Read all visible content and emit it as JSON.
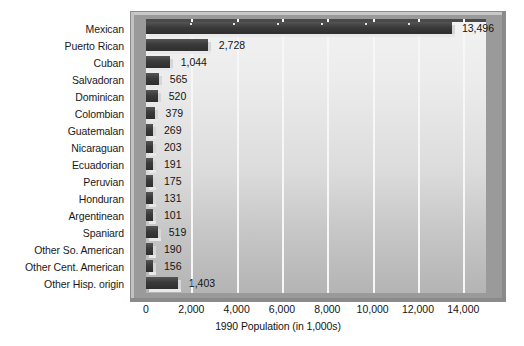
{
  "chart_data": {
    "type": "bar",
    "orientation": "horizontal",
    "title": "",
    "xlabel": "1990 Population (in 1,000s)",
    "ylabel": "",
    "xlim": [
      0,
      15000
    ],
    "grid": true,
    "legend": "none",
    "xticks": [
      "0",
      "2,000",
      "4,000",
      "6,000",
      "8,000",
      "10,000",
      "12,000",
      "14,000"
    ],
    "xtick_values": [
      0,
      2000,
      4000,
      6000,
      8000,
      10000,
      12000,
      14000
    ],
    "categories": [
      "Mexican",
      "Puerto Rican",
      "Cuban",
      "Salvadoran",
      "Dominican",
      "Colombian",
      "Guatemalan",
      "Nicaraguan",
      "Ecuadorian",
      "Peruvian",
      "Honduran",
      "Argentinean",
      "Spaniard",
      "Other So. American",
      "Other Cent. American",
      "Other Hisp. origin"
    ],
    "values": [
      13496,
      2728,
      1044,
      565,
      520,
      379,
      269,
      203,
      191,
      175,
      131,
      101,
      519,
      190,
      156,
      1403
    ],
    "value_labels": [
      "13,496",
      "2,728",
      "1,044",
      "565",
      "520",
      "379",
      "269",
      "203",
      "191",
      "175",
      "131",
      "101",
      "519",
      "190",
      "156",
      "1,403"
    ],
    "colors": {
      "bar": "#3a3a3a",
      "bar_highlight": "#555555",
      "bar_depth": "#e9e9e9",
      "panel_light": "#f2f2f2",
      "panel_dark": "#b4b4b4",
      "frame": "#9a9a9a",
      "gridline": "#f7f7f7",
      "text": "#141414"
    }
  }
}
